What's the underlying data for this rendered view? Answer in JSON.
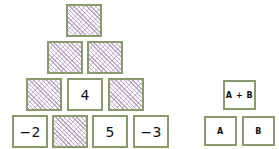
{
  "figure": {
    "kind": "addition-pyramid",
    "border_color": "#8a9a6b",
    "hatch_color": "#a886b4",
    "background": "#ffffff"
  },
  "pyramid": {
    "name": "addition-pyramid",
    "rows": [
      {
        "index": 1,
        "cells": [
          {
            "id": "r1c1",
            "value": "",
            "state": "hatched"
          }
        ]
      },
      {
        "index": 2,
        "cells": [
          {
            "id": "r2c1",
            "value": "",
            "state": "hatched"
          },
          {
            "id": "r2c2",
            "value": "",
            "state": "hatched"
          }
        ]
      },
      {
        "index": 3,
        "cells": [
          {
            "id": "r3c1",
            "value": "",
            "state": "hatched"
          },
          {
            "id": "r3c2",
            "value": "4",
            "state": "filled"
          },
          {
            "id": "r3c3",
            "value": "",
            "state": "hatched"
          }
        ]
      },
      {
        "index": 4,
        "cells": [
          {
            "id": "r4c1",
            "value": "−2",
            "state": "filled"
          },
          {
            "id": "r4c2",
            "value": "",
            "state": "hatched"
          },
          {
            "id": "r4c3",
            "value": "5",
            "state": "filled"
          },
          {
            "id": "r4c4",
            "value": "−3",
            "state": "filled"
          }
        ]
      }
    ]
  },
  "legend": {
    "name": "sum-rule-legend",
    "sum_cell": {
      "id": "legend-sum",
      "value": "A + B"
    },
    "operand_cells": [
      {
        "id": "legend-a",
        "value": "A"
      },
      {
        "id": "legend-b",
        "value": "B"
      }
    ]
  }
}
